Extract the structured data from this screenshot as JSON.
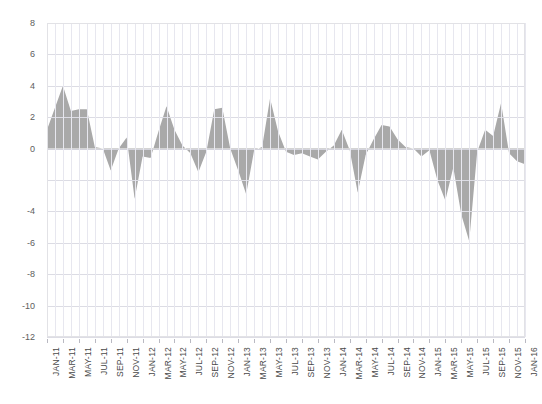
{
  "chart_data": {
    "type": "area",
    "title": "",
    "subtitle": "",
    "xlabel": "",
    "ylabel": "",
    "ylim": [
      -12,
      8
    ],
    "grid": true,
    "legend": null,
    "fill_color": "#a9a9a9",
    "zero_baseline": 0,
    "x_tick_interval_months": 2,
    "x_tick_labels": [
      "JAN-11",
      "MAR-11",
      "MAY-11",
      "JUL-11",
      "SEP-11",
      "NOV-11",
      "JAN-12",
      "MAR-12",
      "MAY-12",
      "JUL-12",
      "SEP-12",
      "NOV-12",
      "JAN-13",
      "MAR-13",
      "MAY-13",
      "JUL-13",
      "SEP-13",
      "NOV-13",
      "JAN-14",
      "MAR-14",
      "MAY-14",
      "JUL-14",
      "SEP-14",
      "NOV-14",
      "JAN-15",
      "MAR-15",
      "MAY-15",
      "JUL-15",
      "SEP-15",
      "NOV-15",
      "JAN-16"
    ],
    "y_tick_values": [
      8,
      6,
      4,
      2,
      0,
      -2,
      -4,
      -6,
      -8,
      -10,
      -12
    ],
    "y_tick_labels": [
      "8",
      "6",
      "4",
      "2",
      "0",
      "",
      "-4",
      "-6",
      "-8",
      "-10",
      "-12"
    ],
    "x": [
      "JAN-11",
      "FEB-11",
      "MAR-11",
      "APR-11",
      "MAY-11",
      "JUN-11",
      "JUL-11",
      "AUG-11",
      "SEP-11",
      "OCT-11",
      "NOV-11",
      "DEC-11",
      "JAN-12",
      "FEB-12",
      "MAR-12",
      "APR-12",
      "MAY-12",
      "JUN-12",
      "JUL-12",
      "AUG-12",
      "SEP-12",
      "OCT-12",
      "NOV-12",
      "DEC-12",
      "JAN-13",
      "FEB-13",
      "MAR-13",
      "APR-13",
      "MAY-13",
      "JUN-13",
      "JUL-13",
      "AUG-13",
      "SEP-13",
      "OCT-13",
      "NOV-13",
      "DEC-13",
      "JAN-14",
      "FEB-14",
      "MAR-14",
      "APR-14",
      "MAY-14",
      "JUN-14",
      "JUL-14",
      "AUG-14",
      "SEP-14",
      "OCT-14",
      "NOV-14",
      "DEC-14",
      "JAN-15",
      "FEB-15",
      "MAR-15",
      "APR-15",
      "MAY-15",
      "JUN-15",
      "JUL-15",
      "AUG-15",
      "SEP-15",
      "OCT-15",
      "NOV-15",
      "DEC-15",
      "JAN-16"
    ],
    "values": [
      1.2,
      2.6,
      4.0,
      2.4,
      2.5,
      2.5,
      0.1,
      0.0,
      -1.4,
      0.0,
      0.7,
      -3.2,
      -0.5,
      -0.6,
      1.1,
      2.7,
      1.2,
      0.2,
      -0.3,
      -1.5,
      -0.2,
      2.5,
      2.6,
      0.0,
      -1.4,
      -2.9,
      -0.1,
      0.1,
      3.2,
      1.1,
      -0.2,
      -0.4,
      -0.3,
      -0.5,
      -0.7,
      -0.2,
      0.2,
      1.2,
      -0.1,
      -2.8,
      -0.4,
      0.6,
      1.5,
      1.4,
      0.6,
      0.1,
      0.0,
      -0.5,
      -0.1,
      -2.0,
      -3.3,
      -1.2,
      -4.2,
      -5.9,
      -0.2,
      1.2,
      0.8,
      2.9,
      -0.3,
      -0.8,
      -1.0
    ],
    "values_detail_note": "monthly series, 61 points JAN-11 through JAN-16"
  }
}
